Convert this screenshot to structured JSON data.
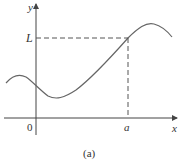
{
  "figure": {
    "caption": "(a)",
    "axes": {
      "x_label": "x",
      "y_label": "y",
      "origin_label": "0"
    },
    "markers": {
      "x_marker": "a",
      "y_marker": "L"
    },
    "colors": {
      "curve": "#666666",
      "axes": "#444444",
      "dashed": "#555555"
    }
  }
}
